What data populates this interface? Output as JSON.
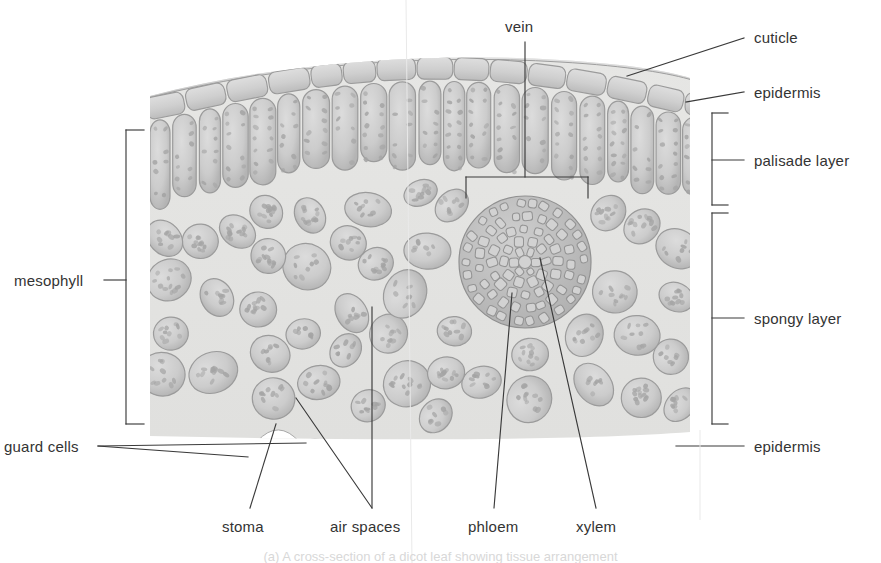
{
  "figure": {
    "caption": "(a) A cross-section of a dicot leaf showing tissue arrangement",
    "palette": {
      "cell_wall": "#9a9a9a",
      "cell_fill": "#c9c9c9",
      "tissue_bg": "#e3e3e1",
      "chloroplast": "#a2a2a2",
      "leader_line": "#3a3a3a",
      "label_text": "#333333",
      "air_space": "#eeeeec"
    }
  },
  "labels": {
    "vein": "vein",
    "cuticle": "cuticle",
    "epidermis_top": "epidermis",
    "palisade_layer": "palisade layer",
    "spongy_layer": "spongy layer",
    "epidermis_bottom": "epidermis",
    "mesophyll": "mesophyll",
    "guard_cells": "guard cells",
    "stoma": "stoma",
    "air_spaces": "air spaces",
    "phloem": "phloem",
    "xylem": "xylem"
  },
  "structures": [
    {
      "name": "cuticle",
      "description": "thin waxy strip along the upper and lower outer surface"
    },
    {
      "name": "upper epidermis",
      "description": "single row of rectangular cells beneath the cuticle"
    },
    {
      "name": "palisade layer",
      "description": "tall columnar chloroplast-rich cells just below upper epidermis"
    },
    {
      "name": "spongy layer",
      "description": "rounded loosely packed cells with large air spaces between them"
    },
    {
      "name": "vein",
      "description": "circular vascular bundle of small polygonal cells in the mesophyll"
    },
    {
      "name": "xylem",
      "description": "inner vascular tissue of the vein"
    },
    {
      "name": "phloem",
      "description": "outer vascular tissue of the vein"
    },
    {
      "name": "lower epidermis",
      "description": "single row of cells on the underside, interrupted by a stoma"
    },
    {
      "name": "guard cells",
      "description": "pair of bean-shaped cells flanking the stomatal pore"
    },
    {
      "name": "stoma",
      "description": "pore in the lower epidermis for gas exchange"
    },
    {
      "name": "air spaces",
      "description": "intercellular gaps within the spongy mesophyll"
    }
  ],
  "brackets": {
    "mesophyll": {
      "spans": [
        "palisade layer",
        "spongy layer"
      ],
      "side": "left"
    },
    "palisade_layer": {
      "side": "right"
    },
    "spongy_layer": {
      "side": "right"
    },
    "vein": {
      "side": "top"
    }
  }
}
